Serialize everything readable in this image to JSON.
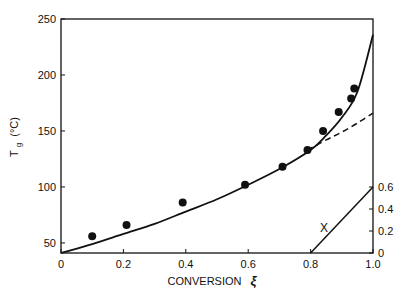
{
  "chart_data": {
    "type": "scatter",
    "title": "",
    "xlabel": "CONVERSION",
    "xlabel_symbol": "ξ",
    "ylabel": "Tg (°C)",
    "ylabel_main": "T",
    "ylabel_sub": "g",
    "ylabel_unit": "(°C)",
    "xlim": [
      0,
      1.0
    ],
    "ylim": [
      41,
      250
    ],
    "grid": false,
    "x_ticks": [
      "0",
      "0.2",
      "0.4",
      "0.6",
      "0.8",
      "1.0"
    ],
    "x_tick_values": [
      0,
      0.2,
      0.4,
      0.6,
      0.8,
      1.0
    ],
    "y_ticks": [
      "50",
      "100",
      "150",
      "200",
      "250"
    ],
    "y_tick_values": [
      50,
      100,
      150,
      200,
      250
    ],
    "series": [
      {
        "name": "Measured Tg",
        "style": "filled-circle",
        "x": [
          0.1,
          0.21,
          0.39,
          0.59,
          0.71,
          0.79,
          0.84,
          0.89,
          0.93,
          0.94
        ],
        "y": [
          56,
          66,
          86,
          102,
          118,
          133,
          150,
          167,
          179,
          188
        ]
      },
      {
        "name": "Model (solid)",
        "style": "solid-line",
        "x": [
          0,
          0.1,
          0.2,
          0.3,
          0.4,
          0.5,
          0.6,
          0.7,
          0.8,
          0.85,
          0.9,
          0.95,
          1.0
        ],
        "y": [
          41,
          49,
          58,
          67,
          78,
          89,
          102,
          116,
          133,
          146,
          162,
          185,
          236
        ]
      },
      {
        "name": "Model (dashed)",
        "style": "dashed-line",
        "x": [
          0.79,
          0.85,
          0.9,
          0.95,
          1.0
        ],
        "y": [
          133,
          142,
          149,
          157,
          166
        ]
      }
    ],
    "inset": {
      "label": "X",
      "right_axis_ticks": [
        "0",
        "0.2",
        "0.4",
        "0.6"
      ],
      "right_axis_values": [
        0,
        0.2,
        0.4,
        0.6
      ],
      "line": {
        "x": [
          0.8,
          1.0
        ],
        "y": [
          0,
          0.6
        ]
      }
    }
  }
}
